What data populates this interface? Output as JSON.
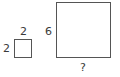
{
  "diagram": {
    "small_square": {
      "top_label": "2",
      "left_label": "2"
    },
    "large_square": {
      "left_label": "6",
      "bottom_label": "?"
    },
    "colors": {
      "stroke": "#555555",
      "text": "#3a3a3a",
      "background": "#ffffff"
    }
  }
}
